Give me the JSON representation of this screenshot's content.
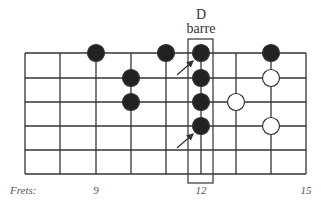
{
  "title": {
    "chord": "D",
    "type": "barre"
  },
  "frets_label": "Frets:",
  "fret_numbers": [
    {
      "label": "9",
      "x": 96
    },
    {
      "label": "12",
      "x": 201
    },
    {
      "label": "15",
      "x": 306
    }
  ],
  "grid": {
    "x_lines": [
      25,
      60,
      96,
      131,
      166,
      201,
      236,
      271,
      306
    ],
    "y_lines": [
      53,
      78,
      102,
      126,
      150,
      174
    ],
    "line_color": "#333333"
  },
  "barre_box": {
    "x": 188,
    "y": 39,
    "w": 25,
    "h": 144
  },
  "dots": [
    {
      "x": 96,
      "y": 53,
      "fill": "black"
    },
    {
      "x": 131,
      "y": 78,
      "fill": "black"
    },
    {
      "x": 131,
      "y": 102,
      "fill": "black"
    },
    {
      "x": 166,
      "y": 53,
      "fill": "black"
    },
    {
      "x": 201,
      "y": 53,
      "fill": "black"
    },
    {
      "x": 201,
      "y": 78,
      "fill": "black"
    },
    {
      "x": 201,
      "y": 102,
      "fill": "black"
    },
    {
      "x": 201,
      "y": 126,
      "fill": "black"
    },
    {
      "x": 271,
      "y": 53,
      "fill": "black"
    },
    {
      "x": 236,
      "y": 102,
      "fill": "white"
    },
    {
      "x": 271,
      "y": 78,
      "fill": "white"
    },
    {
      "x": 271,
      "y": 126,
      "fill": "white"
    }
  ],
  "arrows": [
    {
      "x1": 177,
      "y1": 75,
      "x2": 193,
      "y2": 61
    },
    {
      "x1": 177,
      "y1": 148,
      "x2": 193,
      "y2": 134
    }
  ],
  "colors": {
    "dot_black": "#222222",
    "dot_white": "#ffffff",
    "stroke": "#333333"
  }
}
